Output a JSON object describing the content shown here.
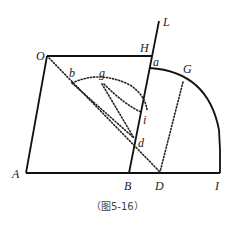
{
  "figure": {
    "caption": "（图5-16）",
    "points": {
      "O": {
        "label": "O",
        "x": 47,
        "y": 56
      },
      "H": {
        "label": "H",
        "x": 152,
        "y": 56
      },
      "L": {
        "label": "L",
        "x": 159,
        "y": 21
      },
      "a": {
        "label": "a",
        "x": 150,
        "y": 68
      },
      "G": {
        "label": "G",
        "x": 182,
        "y": 80
      },
      "b": {
        "label": "b",
        "x": 72,
        "y": 79
      },
      "g": {
        "label": "g",
        "x": 101,
        "y": 79
      },
      "i": {
        "label": "i",
        "x": 141,
        "y": 110
      },
      "d": {
        "label": "d",
        "x": 134,
        "y": 138
      },
      "A": {
        "label": "A",
        "x": 26,
        "y": 173
      },
      "B": {
        "label": "B",
        "x": 129,
        "y": 173
      },
      "D": {
        "label": "D",
        "x": 160,
        "y": 173
      },
      "I": {
        "label": "I",
        "x": 220,
        "y": 173
      }
    },
    "solid_lines": [
      "O-H",
      "O-A",
      "A-I",
      "L-B",
      "arc a-I"
    ],
    "dotted_lines": [
      "O-D",
      "b-d arc",
      "g-d",
      "G-D",
      "b-g-i arc"
    ]
  }
}
